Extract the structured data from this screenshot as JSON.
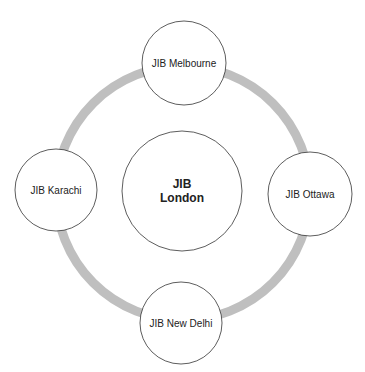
{
  "diagram": {
    "type": "hub-ring",
    "ring": {
      "cx": 183,
      "cy": 193,
      "r": 127,
      "stroke": "#bfbfbf",
      "width": 9
    },
    "center": {
      "id": "london",
      "lines": [
        "JIB",
        "London"
      ],
      "cx": 182,
      "cy": 191,
      "r": 60,
      "bold": true
    },
    "nodes": [
      {
        "id": "melbourne",
        "label": "JIB Melbourne",
        "cx": 184,
        "cy": 63,
        "r": 42
      },
      {
        "id": "ottawa",
        "label": "JIB Ottawa",
        "cx": 310,
        "cy": 194,
        "r": 42
      },
      {
        "id": "new-delhi",
        "label": "JIB New Delhi",
        "cx": 181,
        "cy": 323,
        "r": 41
      },
      {
        "id": "karachi",
        "label": "JIB Karachi",
        "cx": 56,
        "cy": 190,
        "r": 41
      }
    ],
    "colors": {
      "node_fill": "#ffffff",
      "node_stroke": "#333333",
      "text": "#222222"
    }
  }
}
